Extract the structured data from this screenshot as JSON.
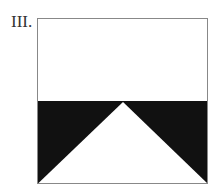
{
  "label": "III.",
  "figure": {
    "colors": {
      "border": "#888888",
      "fill": "#111111",
      "background": "#ffffff"
    }
  }
}
